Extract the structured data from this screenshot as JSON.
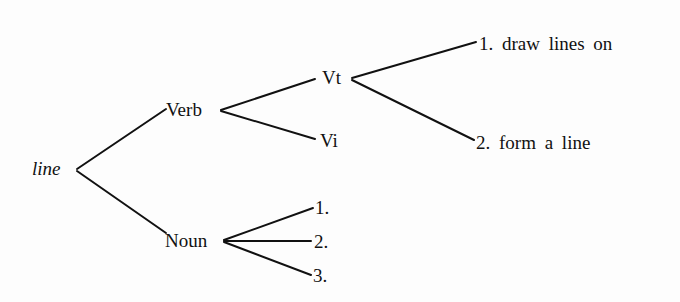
{
  "diagram": {
    "type": "tree",
    "root": {
      "label": "line"
    },
    "nodes": {
      "verb": {
        "label": "Verb"
      },
      "noun": {
        "label": "Noun"
      },
      "vt": {
        "label": "Vt"
      },
      "vi": {
        "label": "Vi"
      },
      "vt_sense_1": {
        "label": "1. draw lines on"
      },
      "vt_sense_2": {
        "label": "2. form a line"
      },
      "noun_sense_1": {
        "label": "1."
      },
      "noun_sense_2": {
        "label": "2."
      },
      "noun_sense_3": {
        "label": "3."
      }
    },
    "edges": [
      [
        "line",
        "Verb"
      ],
      [
        "line",
        "Noun"
      ],
      [
        "Verb",
        "Vt"
      ],
      [
        "Verb",
        "Vi"
      ],
      [
        "Vt",
        "1. draw lines on"
      ],
      [
        "Vt",
        "2. form a line"
      ],
      [
        "Noun",
        "1."
      ],
      [
        "Noun",
        "2."
      ],
      [
        "Noun",
        "3."
      ]
    ],
    "colors": {
      "line": "#111111",
      "background": "#fdfdfd"
    }
  }
}
